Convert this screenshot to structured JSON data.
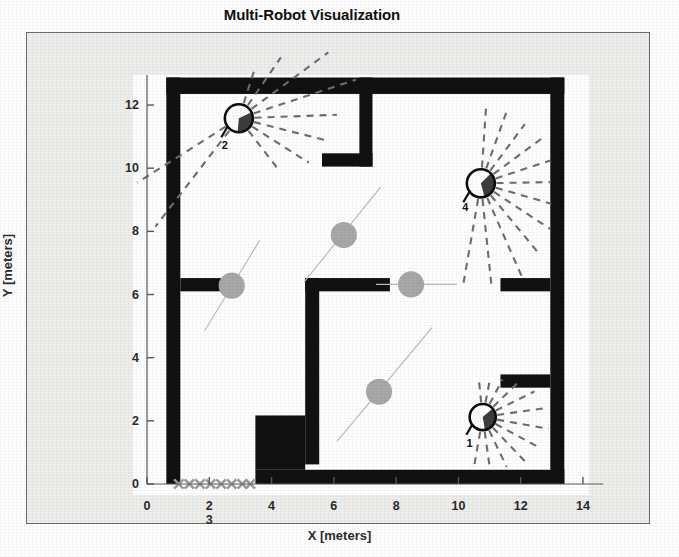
{
  "figure": {
    "title": "Multi-Robot Visualization",
    "background_color": "#eeeeec",
    "plot_background_color": "#ffffff",
    "frame_color": "#6b6b6b",
    "wall_color": "#111111",
    "ray_color": "#6e6e6e",
    "particle_color": "#a8a8a8",
    "trail_color": "#b9b9b9",
    "marker_x_color": "#9a9a9a"
  },
  "axes": {
    "x_label": "X [meters]",
    "y_label": "Y [meters]",
    "x_ticks": [
      "0",
      "2",
      "4",
      "6",
      "8",
      "10",
      "12",
      "14"
    ],
    "x_tick_values": [
      0,
      2,
      4,
      6,
      8,
      10,
      12,
      14
    ],
    "y_ticks": [
      "0",
      "2",
      "4",
      "6",
      "8",
      "10",
      "12"
    ],
    "y_tick_values": [
      0,
      2,
      4,
      6,
      8,
      10,
      12
    ],
    "x_extra_tick_label": "3",
    "x_extra_tick_value": 2,
    "xlim": [
      -0.45,
      14.2
    ],
    "ylim": [
      -0.35,
      12.95
    ],
    "grid": false
  },
  "chart_data": {
    "type": "scatter",
    "title": "Multi-Robot Visualization",
    "xlabel": "X [meters]",
    "ylabel": "Y [meters]",
    "xlim": [
      -0.45,
      14.2
    ],
    "ylim": [
      -0.35,
      12.95
    ],
    "grid": false,
    "legend": "none",
    "robots": [
      {
        "id": "2",
        "x": 2.95,
        "y": 11.58,
        "radius_m": 0.45,
        "heading_deg": -35,
        "id_label_offset": [
          -0.45,
          -0.85
        ],
        "rays": [
          {
            "angle_deg": 72,
            "range_m": 1.55
          },
          {
            "angle_deg": 55,
            "range_m": 2.35
          },
          {
            "angle_deg": 36,
            "range_m": 3.55
          },
          {
            "angle_deg": 18,
            "range_m": 3.95
          },
          {
            "angle_deg": 2,
            "range_m": 3.15
          },
          {
            "angle_deg": -14,
            "range_m": 2.95
          },
          {
            "angle_deg": -32,
            "range_m": 2.65
          },
          {
            "angle_deg": -52,
            "range_m": 2.05
          },
          {
            "angle_deg": -128,
            "range_m": 4.35
          },
          {
            "angle_deg": -148,
            "range_m": 3.85
          }
        ]
      },
      {
        "id": "4",
        "x": 10.72,
        "y": 9.52,
        "radius_m": 0.45,
        "heading_deg": -15,
        "id_label_offset": [
          -0.5,
          -0.75
        ],
        "rays": [
          {
            "angle_deg": 86,
            "range_m": 2.55
          },
          {
            "angle_deg": 70,
            "range_m": 2.45
          },
          {
            "angle_deg": 53,
            "range_m": 2.35
          },
          {
            "angle_deg": 36,
            "range_m": 2.45
          },
          {
            "angle_deg": 18,
            "range_m": 2.35
          },
          {
            "angle_deg": 1,
            "range_m": 2.25
          },
          {
            "angle_deg": -16,
            "range_m": 2.35
          },
          {
            "angle_deg": -33,
            "range_m": 2.65
          },
          {
            "angle_deg": -50,
            "range_m": 2.95
          },
          {
            "angle_deg": -66,
            "range_m": 3.25
          },
          {
            "angle_deg": -84,
            "range_m": 3.35
          },
          {
            "angle_deg": -100,
            "range_m": 3.25
          }
        ]
      },
      {
        "id": "1",
        "x": 10.78,
        "y": 2.12,
        "radius_m": 0.42,
        "heading_deg": -20,
        "id_label_offset": [
          -0.42,
          -0.82
        ],
        "rays": [
          {
            "angle_deg": 96,
            "range_m": 1.15
          },
          {
            "angle_deg": 79,
            "range_m": 1.25
          },
          {
            "angle_deg": 62,
            "range_m": 1.35
          },
          {
            "angle_deg": 44,
            "range_m": 1.55
          },
          {
            "angle_deg": 26,
            "range_m": 1.85
          },
          {
            "angle_deg": 8,
            "range_m": 2.05
          },
          {
            "angle_deg": -10,
            "range_m": 2.15
          },
          {
            "angle_deg": -28,
            "range_m": 2.05
          },
          {
            "angle_deg": -46,
            "range_m": 1.95
          },
          {
            "angle_deg": -64,
            "range_m": 1.75
          },
          {
            "angle_deg": -82,
            "range_m": 1.65
          },
          {
            "angle_deg": -100,
            "range_m": 1.65
          }
        ]
      }
    ],
    "particles": [
      {
        "x": 2.72,
        "y": 6.28,
        "r_m": 0.42
      },
      {
        "x": 6.32,
        "y": 7.88,
        "r_m": 0.42
      },
      {
        "x": 8.48,
        "y": 6.32,
        "r_m": 0.42
      },
      {
        "x": 7.45,
        "y": 2.92,
        "r_m": 0.42
      }
    ],
    "trails": [
      {
        "x1": 1.85,
        "y1": 4.85,
        "x2": 3.62,
        "y2": 7.72
      },
      {
        "x1": 5.05,
        "y1": 6.4,
        "x2": 7.5,
        "y2": 9.4
      },
      {
        "x1": 7.35,
        "y1": 6.32,
        "x2": 9.95,
        "y2": 6.32
      },
      {
        "x1": 6.1,
        "y1": 1.35,
        "x2": 9.15,
        "y2": 4.95
      }
    ],
    "floor_markers_x": {
      "y": 0.0,
      "xs": [
        1.02,
        1.36,
        1.7,
        2.04,
        2.38,
        2.72,
        3.06,
        3.32
      ],
      "size_m": 0.3
    },
    "walls": [
      {
        "name": "outer-top",
        "x": 0.62,
        "y": 12.35,
        "w": 12.78,
        "h": 0.52
      },
      {
        "name": "outer-left",
        "x": 0.62,
        "y": 0.0,
        "w": 0.45,
        "h": 12.87
      },
      {
        "name": "outer-right",
        "x": 12.95,
        "y": 0.0,
        "w": 0.45,
        "h": 12.87
      },
      {
        "name": "outer-bottom",
        "x": 3.48,
        "y": 0.0,
        "w": 9.92,
        "h": 0.45
      },
      {
        "name": "top-divider-vert",
        "x": 6.82,
        "y": 10.05,
        "w": 0.42,
        "h": 2.82
      },
      {
        "name": "top-divider-horiz",
        "x": 5.62,
        "y": 10.05,
        "w": 1.62,
        "h": 0.42
      },
      {
        "name": "left-stub",
        "x": 1.07,
        "y": 6.1,
        "w": 1.32,
        "h": 0.42
      },
      {
        "name": "mid-room-vert",
        "x": 5.08,
        "y": 0.62,
        "w": 0.45,
        "h": 5.9
      },
      {
        "name": "mid-room-horiz",
        "x": 5.08,
        "y": 6.1,
        "w": 2.72,
        "h": 0.42
      },
      {
        "name": "right-stub-upper",
        "x": 11.35,
        "y": 6.1,
        "w": 1.6,
        "h": 0.42
      },
      {
        "name": "right-stub-lower",
        "x": 11.35,
        "y": 3.05,
        "w": 1.6,
        "h": 0.42
      },
      {
        "name": "lower-block",
        "x": 3.48,
        "y": 0.45,
        "w": 1.6,
        "h": 1.72
      }
    ]
  }
}
